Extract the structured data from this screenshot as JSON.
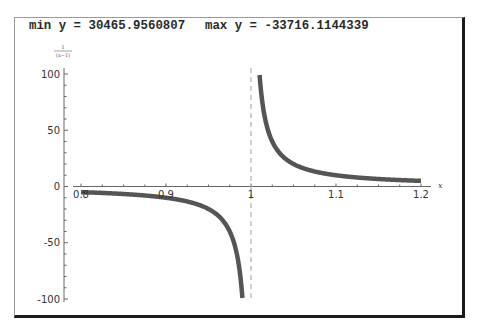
{
  "header": {
    "min_label": "min y = 30465.9560807",
    "max_label": "max y = -33716.1144339"
  },
  "chart_data": {
    "type": "line",
    "function": "1/(x-1)",
    "ylabel_numerator": "1",
    "ylabel_denominator": "(x−1)",
    "xlabel": "x",
    "xlim": [
      0.8,
      1.2
    ],
    "ylim": [
      -100,
      100
    ],
    "x_ticks": [
      {
        "value": 0.8,
        "label": "0.8"
      },
      {
        "value": 0.9,
        "label": "0.9"
      },
      {
        "value": 1.0,
        "label": "1"
      },
      {
        "value": 1.1,
        "label": "1.1"
      },
      {
        "value": 1.2,
        "label": "1.2"
      }
    ],
    "y_ticks": [
      {
        "value": 100,
        "label": "100"
      },
      {
        "value": 50,
        "label": "50"
      },
      {
        "value": 0,
        "label": "0"
      },
      {
        "value": -50,
        "label": "-50"
      },
      {
        "value": -100,
        "label": "-100"
      }
    ],
    "asymptote_x": 1.0,
    "series": [
      {
        "name": "left branch",
        "x": [
          0.8,
          0.85,
          0.9,
          0.93,
          0.95,
          0.97,
          0.98,
          0.985,
          0.99
        ],
        "y": [
          -5,
          -6.67,
          -10,
          -14.29,
          -20,
          -33.33,
          -50,
          -66.67,
          -100
        ]
      },
      {
        "name": "right branch",
        "x": [
          1.01,
          1.015,
          1.02,
          1.03,
          1.05,
          1.07,
          1.1,
          1.15,
          1.2
        ],
        "y": [
          100,
          66.67,
          50,
          33.33,
          20,
          14.29,
          10,
          6.67,
          5
        ]
      }
    ],
    "line_color": "#555555",
    "asymptote_color": "#b0b0b0",
    "grid": false
  }
}
